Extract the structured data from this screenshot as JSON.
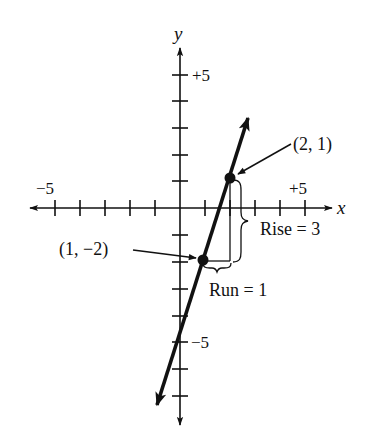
{
  "figure": {
    "type": "slope-diagram",
    "axes": {
      "x_label": "x",
      "y_label": "y",
      "x_tick_label_neg": "−5",
      "x_tick_label_pos": "+5",
      "y_tick_label_pos": "+5",
      "y_tick_label_neg": "−5",
      "x_range": [
        -6,
        6
      ],
      "y_range": [
        -7,
        6
      ]
    },
    "line": {
      "slope": 3,
      "intercept": -5,
      "description": "y = 3x − 5"
    },
    "points": [
      {
        "label": "(2, 1)",
        "x": 2,
        "y": 1
      },
      {
        "label": "(1, −2)",
        "x": 1,
        "y": -2
      }
    ],
    "annotations": {
      "rise": "Rise = 3",
      "run": "Run = 1"
    },
    "colors": {
      "ink": "#111111",
      "background": "#ffffff"
    }
  }
}
